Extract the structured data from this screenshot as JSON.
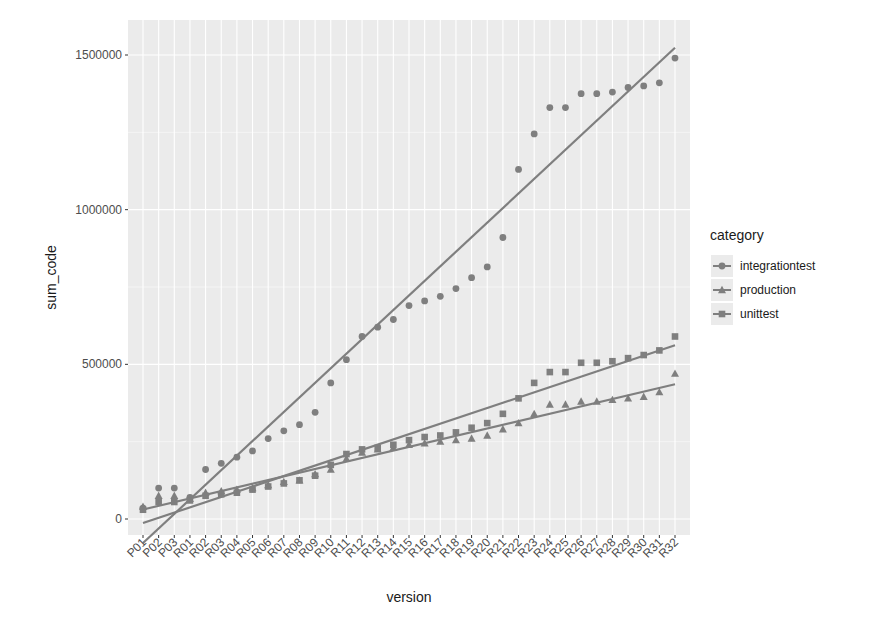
{
  "chart_data": {
    "type": "scatter",
    "title": "",
    "xlabel": "version",
    "ylabel": "sum_code",
    "ylim": [
      -50000,
      1600000
    ],
    "yticks": [
      0,
      500000,
      1000000,
      1500000
    ],
    "ytick_labels": [
      "0",
      "500000",
      "1000000",
      "1500000"
    ],
    "grid": true,
    "legend_position": "right",
    "legend_title": "category",
    "categories": [
      "P01",
      "P02",
      "P03",
      "R01",
      "R02",
      "R03",
      "R04",
      "R05",
      "R06",
      "R07",
      "R08",
      "R09",
      "R10",
      "R11",
      "R12",
      "R13",
      "R14",
      "R15",
      "R16",
      "R17",
      "R18",
      "R19",
      "R20",
      "R21",
      "R22",
      "R23",
      "R24",
      "R25",
      "R26",
      "R27",
      "R28",
      "R29",
      "R30",
      "R31",
      "R32"
    ],
    "series": [
      {
        "name": "integrationtest",
        "marker": "circle",
        "trendline": "linear",
        "values": [
          35000,
          100000,
          100000,
          70000,
          160000,
          180000,
          200000,
          220000,
          260000,
          285000,
          305000,
          345000,
          440000,
          515000,
          590000,
          620000,
          645000,
          690000,
          705000,
          720000,
          745000,
          780000,
          815000,
          910000,
          1130000,
          1245000,
          1330000,
          1330000,
          1375000,
          1375000,
          1380000,
          1395000,
          1400000,
          1410000,
          1490000
        ]
      },
      {
        "name": "production",
        "marker": "triangle",
        "trendline": "linear",
        "values": [
          40000,
          75000,
          75000,
          65000,
          85000,
          90000,
          95000,
          100000,
          110000,
          120000,
          125000,
          145000,
          160000,
          195000,
          215000,
          225000,
          230000,
          240000,
          245000,
          250000,
          255000,
          260000,
          270000,
          290000,
          310000,
          340000,
          370000,
          370000,
          380000,
          380000,
          385000,
          390000,
          395000,
          410000,
          470000
        ]
      },
      {
        "name": "unittest",
        "marker": "square",
        "trendline": "linear",
        "values": [
          30000,
          55000,
          55000,
          60000,
          75000,
          80000,
          85000,
          95000,
          105000,
          115000,
          125000,
          140000,
          175000,
          210000,
          225000,
          230000,
          240000,
          255000,
          265000,
          270000,
          280000,
          295000,
          310000,
          340000,
          390000,
          440000,
          475000,
          475000,
          505000,
          505000,
          510000,
          520000,
          530000,
          545000,
          590000
        ]
      }
    ]
  },
  "style": {
    "panel_bg": "#ebebeb",
    "grid_color": "#ffffff",
    "series_color": "#7f7f7f",
    "text_color": "#1a1a1a",
    "axis_text_color": "#4d4d4d"
  }
}
